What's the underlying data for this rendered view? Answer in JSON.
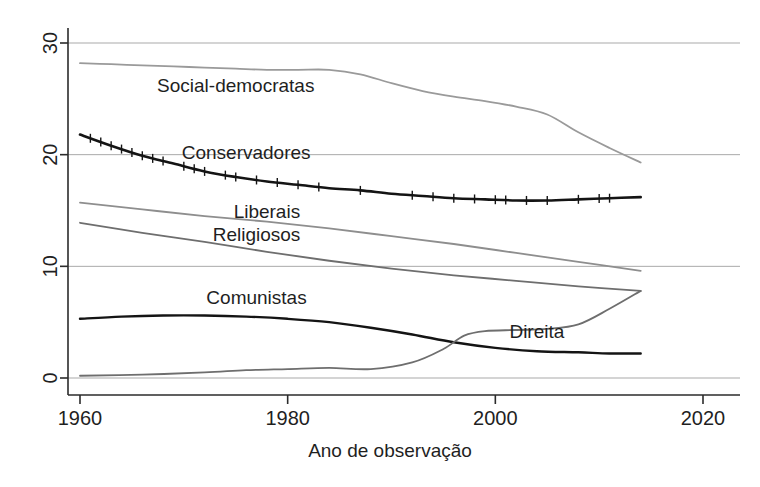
{
  "chart_data": {
    "type": "line",
    "title": "",
    "xlabel": "Ano de observação",
    "ylabel": "",
    "xlim": [
      1958,
      2022
    ],
    "ylim": [
      0,
      30
    ],
    "xticks": [
      1960,
      1980,
      2000,
      2020
    ],
    "xtick_labels": [
      "1960",
      "1980",
      "2000",
      "2020"
    ],
    "yticks": [
      0,
      10,
      20,
      30
    ],
    "ytick_labels": [
      "0",
      "10",
      "20",
      "30"
    ],
    "grid": "horizontal",
    "legend": "inline-annotations",
    "series": [
      {
        "name": "Social-democratas",
        "label": "Social-democratas",
        "color": "#9a9a9a",
        "width": 1.8,
        "label_x": 1975,
        "label_y": 25.6,
        "x": [
          1960,
          1963,
          1966,
          1969,
          1972,
          1975,
          1978,
          1981,
          1984,
          1987,
          1990,
          1993,
          1996,
          1999,
          2002,
          2005,
          2008,
          2011,
          2014
        ],
        "values": [
          28.2,
          28.1,
          28.0,
          27.9,
          27.8,
          27.7,
          27.6,
          27.6,
          27.6,
          27.2,
          26.4,
          25.7,
          25.2,
          24.8,
          24.3,
          23.6,
          22.0,
          20.6,
          19.3
        ]
      },
      {
        "name": "Conservadores",
        "label": "Conservadores",
        "color": "#141414",
        "width": 2.6,
        "label_x": 1976,
        "label_y": 19.6,
        "x": [
          1960,
          1963,
          1966,
          1969,
          1972,
          1975,
          1978,
          1981,
          1984,
          1987,
          1990,
          1993,
          1996,
          1999,
          2002,
          2005,
          2008,
          2011,
          2014
        ],
        "values": [
          21.8,
          20.8,
          19.9,
          19.2,
          18.5,
          18.0,
          17.6,
          17.3,
          17.0,
          16.8,
          16.5,
          16.3,
          16.1,
          16.0,
          15.9,
          15.9,
          16.0,
          16.1,
          16.2
        ]
      },
      {
        "name": "Liberais",
        "label": "Liberais",
        "color": "#8e8e8e",
        "width": 1.8,
        "label_x": 1978,
        "label_y": 14.3,
        "x": [
          1960,
          1966,
          1972,
          1978,
          1984,
          1990,
          1996,
          2002,
          2008,
          2014
        ],
        "values": [
          15.7,
          15.1,
          14.5,
          14.0,
          13.4,
          12.7,
          12.0,
          11.2,
          10.4,
          9.6
        ]
      },
      {
        "name": "Religiosos",
        "label": "Religiosos",
        "color": "#6e6e6e",
        "width": 1.8,
        "label_x": 1977,
        "label_y": 12.3,
        "x": [
          1960,
          1966,
          1972,
          1978,
          1984,
          1990,
          1996,
          2002,
          2008,
          2014
        ],
        "values": [
          13.9,
          13.0,
          12.2,
          11.3,
          10.5,
          9.8,
          9.2,
          8.7,
          8.2,
          7.8
        ]
      },
      {
        "name": "Comunistas",
        "label": "Comunistas",
        "color": "#141414",
        "width": 2.4,
        "label_x": 1977,
        "label_y": 6.6,
        "x": [
          1960,
          1964,
          1968,
          1972,
          1976,
          1980,
          1984,
          1988,
          1992,
          1996,
          2000,
          2004,
          2008,
          2011,
          2014
        ],
        "values": [
          5.3,
          5.5,
          5.6,
          5.6,
          5.5,
          5.3,
          5.0,
          4.5,
          3.9,
          3.2,
          2.7,
          2.4,
          2.3,
          2.2,
          2.2
        ]
      },
      {
        "name": "Direita",
        "label": "Direita",
        "color": "#6e6e6e",
        "width": 1.8,
        "label_x": 2004,
        "label_y": 3.6,
        "x": [
          1960,
          1966,
          1972,
          1976,
          1980,
          1984,
          1988,
          1992,
          1995,
          1997,
          1999,
          2002,
          2005,
          2008,
          2011,
          2014
        ],
        "values": [
          0.2,
          0.3,
          0.5,
          0.7,
          0.8,
          0.9,
          0.8,
          1.4,
          2.6,
          3.8,
          4.2,
          4.3,
          4.4,
          4.8,
          6.2,
          7.8
        ]
      }
    ],
    "rug_years": [
      1961,
      1962,
      1963,
      1964,
      1965,
      1966,
      1967,
      1968,
      1970,
      1971,
      1972,
      1974,
      1975,
      1977,
      1979,
      1981,
      1983,
      1987,
      1992,
      1994,
      1996,
      1998,
      2000,
      2001,
      2003,
      2005,
      2008,
      2010,
      2011
    ]
  }
}
